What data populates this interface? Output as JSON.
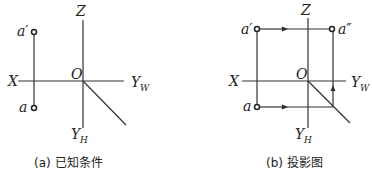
{
  "figures": [
    {
      "id": "a",
      "caption": "(a) 已知条件",
      "labels": {
        "z": "Z",
        "x": "X",
        "origin": "O",
        "yw_main": "Y",
        "yw_sub": "W",
        "yh_main": "Y",
        "yh_sub": "H",
        "point_front": "a′",
        "point_top": "a"
      }
    },
    {
      "id": "b",
      "caption": "(b) 投影图",
      "labels": {
        "z": "Z",
        "x": "X",
        "origin": "O",
        "yw_main": "Y",
        "yw_sub": "W",
        "yh_main": "Y",
        "yh_sub": "H",
        "point_front": "a′",
        "point_side": "a″",
        "point_top": "a"
      }
    }
  ]
}
